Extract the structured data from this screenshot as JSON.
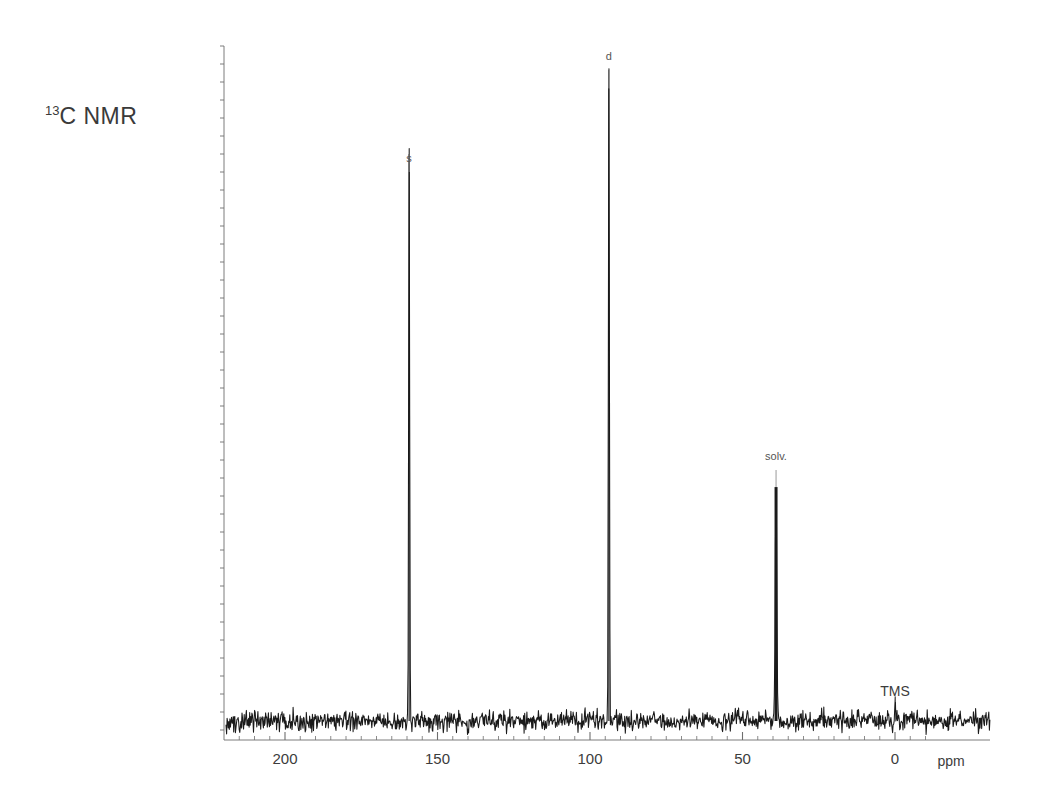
{
  "figure": {
    "title_sup": "13",
    "title_main": "C NMR",
    "title_full": "13C NMR"
  },
  "axis": {
    "unit_label": "ppm",
    "tick_labels": [
      "200",
      "150",
      "100",
      "50",
      "0"
    ],
    "tick_values": [
      200,
      150,
      100,
      50,
      0
    ]
  },
  "annotations": {
    "singlet": "s",
    "doublet": "d",
    "solvent": "solv.",
    "tms": "TMS"
  },
  "chart_data": {
    "type": "line",
    "title": "13C NMR",
    "xlabel": "ppm",
    "ylabel": "",
    "xlim": [
      219,
      -15
    ],
    "ylim": [
      0,
      100
    ],
    "grid": false,
    "legend": "none",
    "x_axis_inverted": true,
    "major_ticks": [
      200,
      150,
      100,
      50,
      0
    ],
    "minor_tick_step": 5,
    "baseline_noise_amplitude": 1.2,
    "peaks": [
      {
        "label": "s",
        "ppm": 159.3,
        "height": 86.0,
        "width_ppm": 0.35,
        "annotated": true
      },
      {
        "label": "d",
        "ppm": 93.8,
        "height": 99.0,
        "width_ppm": 0.35,
        "annotated": true
      },
      {
        "label": "solv.",
        "ppm": 39.0,
        "height": 35.5,
        "width_ppm": 0.55,
        "annotated": true
      },
      {
        "label": "TMS",
        "ppm": 0.0,
        "height": 4.0,
        "width_ppm": 0.3,
        "annotated": true
      }
    ],
    "series": [
      {
        "name": "13C spectrum",
        "color": "#1a1a1a"
      }
    ]
  },
  "style": {
    "trace_color": "#1a1a1a",
    "axis_color": "#6e6e6e",
    "label_color": "#3c3c3c",
    "background": "#ffffff"
  }
}
